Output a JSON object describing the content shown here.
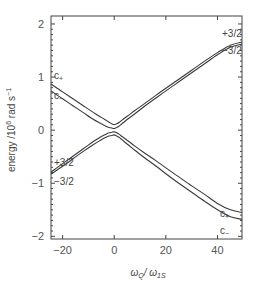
{
  "chart_data": {
    "type": "line",
    "title": "",
    "xlabel": "ω_Q/ ω_1S",
    "xlabel_main": "ω",
    "xlabel_sub1": "Q",
    "xlabel_sep": "/ ω",
    "xlabel_sub2": "1S",
    "ylabel": "energy /10^6 rad s^-1",
    "ylabel_parts": {
      "pre": "energy /10",
      "sup1": "6",
      "mid": " rad s",
      "sup2": "−1"
    },
    "xlim": [
      -24.5,
      49.5
    ],
    "ylim": [
      -2.05,
      2.15
    ],
    "grid": false,
    "x_ticks": [
      -20,
      0,
      20,
      40
    ],
    "x_tick_labels": [
      "−20",
      "0",
      "20",
      "40"
    ],
    "y_ticks": [
      -2,
      -1,
      0,
      1,
      2
    ],
    "y_tick_labels": [
      "−2",
      "−1",
      "0",
      "1",
      "2"
    ],
    "x": [
      -24.5,
      -20,
      -16,
      -12,
      -8,
      -5,
      -3,
      -2,
      -1,
      0,
      1,
      2,
      3,
      5,
      8,
      12,
      16,
      20,
      25,
      30,
      35,
      40,
      45,
      49.5
    ],
    "series": [
      {
        "name": "upper branch (c+ → +3/2)",
        "values": [
          0.87,
          0.72,
          0.59,
          0.46,
          0.33,
          0.24,
          0.18,
          0.15,
          0.12,
          0.1,
          0.12,
          0.15,
          0.19,
          0.26,
          0.37,
          0.51,
          0.65,
          0.79,
          0.96,
          1.13,
          1.3,
          1.46,
          1.6,
          1.66
        ]
      },
      {
        "name": "upper branch (c− → −3/2)",
        "values": [
          0.74,
          0.59,
          0.46,
          0.33,
          0.2,
          0.12,
          0.07,
          0.05,
          0.04,
          0.03,
          0.05,
          0.08,
          0.12,
          0.2,
          0.31,
          0.46,
          0.6,
          0.74,
          0.91,
          1.08,
          1.25,
          1.42,
          1.56,
          1.62
        ]
      },
      {
        "name": "lower branch (+3/2 → c+)",
        "values": [
          -0.79,
          -0.63,
          -0.49,
          -0.35,
          -0.21,
          -0.12,
          -0.07,
          -0.05,
          -0.04,
          -0.03,
          -0.05,
          -0.08,
          -0.12,
          -0.19,
          -0.3,
          -0.44,
          -0.57,
          -0.71,
          -0.88,
          -1.05,
          -1.21,
          -1.38,
          -1.5,
          -1.55
        ]
      },
      {
        "name": "lower branch (−3/2 → c−)",
        "values": [
          -0.83,
          -0.68,
          -0.54,
          -0.4,
          -0.27,
          -0.18,
          -0.13,
          -0.11,
          -0.1,
          -0.09,
          -0.11,
          -0.14,
          -0.18,
          -0.26,
          -0.38,
          -0.53,
          -0.67,
          -0.82,
          -1.0,
          -1.17,
          -1.34,
          -1.5,
          -1.63,
          -1.68
        ]
      }
    ],
    "annotations": [
      {
        "text": "c",
        "sub": "+",
        "position": "upper-left near y=1"
      },
      {
        "text": "c",
        "sub": "−",
        "position": "upper-left below c+"
      },
      {
        "text": "+3/2",
        "sub": "",
        "position": "lower-left above lines"
      },
      {
        "text": "−3/2",
        "sub": "",
        "position": "lower-left below lines"
      },
      {
        "text": "+3/2",
        "sub": "",
        "position": "upper-right above lines"
      },
      {
        "text": "−3/2",
        "sub": "",
        "position": "upper-right below lines"
      },
      {
        "text": "c",
        "sub": "+",
        "position": "lower-right above lines"
      },
      {
        "text": "c",
        "sub": "−",
        "position": "lower-right below lines"
      }
    ]
  }
}
